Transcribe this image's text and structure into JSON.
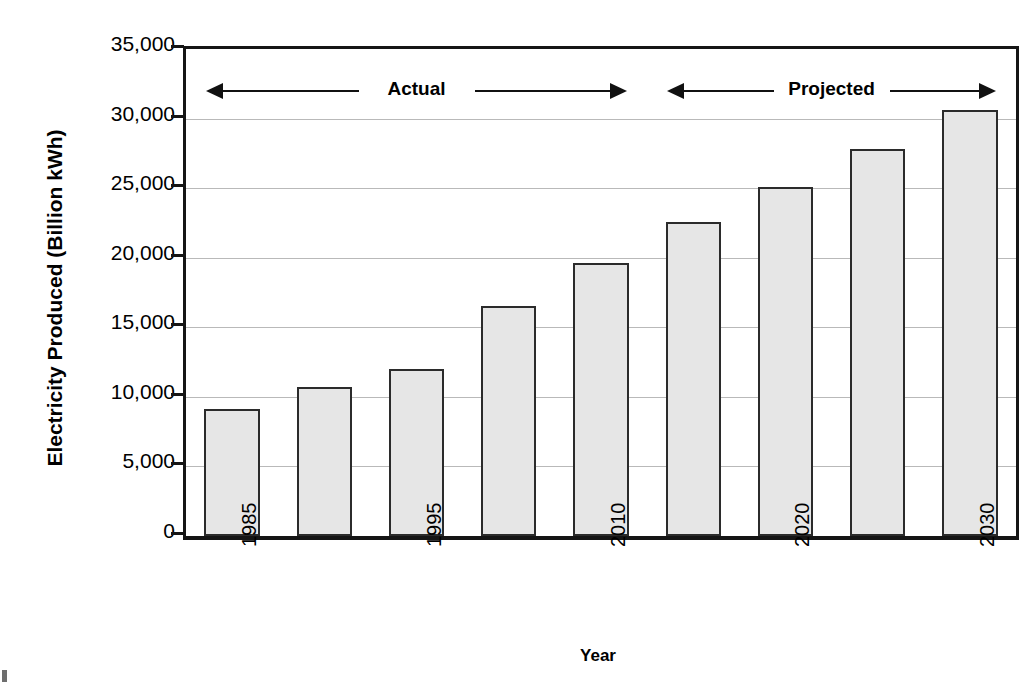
{
  "chart_data": {
    "type": "bar",
    "title": "",
    "xlabel": "Year",
    "ylabel": "Electricity Produced (Billion kWh)",
    "ylim": [
      0,
      35000
    ],
    "ytick_values": [
      0,
      5000,
      10000,
      15000,
      20000,
      25000,
      30000,
      35000
    ],
    "ytick_labels": [
      "0",
      "5,000",
      "10,000",
      "15,000",
      "20,000",
      "25,000",
      "30,000",
      "35,000"
    ],
    "grid": true,
    "legend_position": "none",
    "categories": [
      "1985",
      "1990",
      "1995",
      "2000",
      "2010",
      "2015",
      "2020",
      "2025",
      "2030"
    ],
    "xtick_labels": [
      "1985",
      "",
      "1995",
      "",
      "2010",
      "",
      "2020",
      "",
      "2030"
    ],
    "values": [
      9100,
      10700,
      12000,
      16500,
      19600,
      22600,
      25100,
      27800,
      30600
    ],
    "bar_fill_color": "#e6e6e6",
    "bar_edge_color": "#2b2b2b",
    "annotations": [
      {
        "label": "Actual",
        "span_start": "1985",
        "span_end": "2010",
        "style": "double-arrow"
      },
      {
        "label": "Projected",
        "span_start": "2015",
        "span_end": "2030",
        "style": "double-arrow"
      }
    ]
  },
  "axis": {
    "x_title": "Year",
    "y_title": "Electricity Produced (Billion kWh)"
  }
}
